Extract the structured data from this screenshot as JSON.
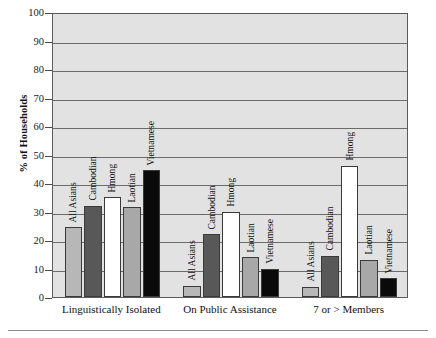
{
  "chart_data": {
    "type": "bar",
    "title": "",
    "xlabel": "",
    "ylabel": "% of Households",
    "ylim": [
      0,
      100
    ],
    "ytick_step": 10,
    "yticks": [
      "100",
      "90",
      "80",
      "70",
      "60",
      "50",
      "40",
      "30",
      "20",
      "10",
      "0"
    ],
    "grid": "horizontal",
    "legend": "none (bars labeled in-place)",
    "categories": [
      "Linguistically Isolated",
      "On Public Assistance",
      "7 or > Members"
    ],
    "series": [
      {
        "name": "All Asians",
        "color": "#b7b7b7",
        "values": [
          24.5,
          4.0,
          3.5
        ]
      },
      {
        "name": "Cambodian",
        "color": "#585858",
        "values": [
          32.0,
          22.0,
          14.5
        ]
      },
      {
        "name": "Hmong",
        "color": "#ffffff",
        "values": [
          35.0,
          30.0,
          46.0
        ]
      },
      {
        "name": "Laotian",
        "color": "#a8a8a8",
        "values": [
          31.5,
          14.0,
          13.0
        ]
      },
      {
        "name": "Vietnamese",
        "color": "#0a0a0a",
        "values": [
          44.5,
          10.0,
          6.5
        ]
      }
    ],
    "plot_background": "#e2e2e2",
    "axis_color": "#5a5a5a"
  }
}
